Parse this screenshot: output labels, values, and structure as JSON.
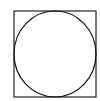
{
  "diagram": {
    "title": "",
    "shapes": [
      {
        "type": "square",
        "x": 14,
        "y": 11,
        "width": 82,
        "height": 86,
        "stroke": "#222222",
        "stroke_width": 1.2
      },
      {
        "type": "circle",
        "cx": 55,
        "cy": 54,
        "rx": 41,
        "ry": 43,
        "stroke": "#111111",
        "stroke_width": 1.2
      }
    ]
  }
}
